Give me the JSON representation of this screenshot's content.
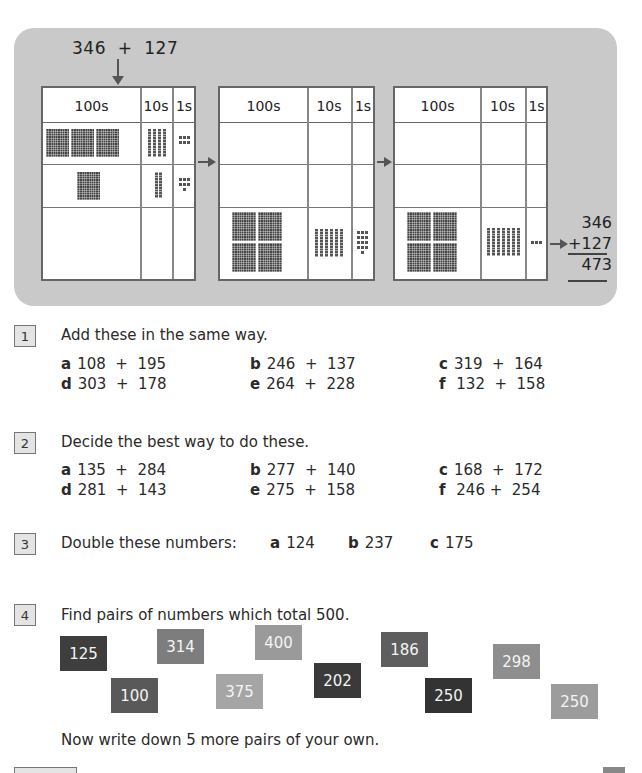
{
  "demo": {
    "expression": "346  +  127",
    "headers": [
      "100s",
      "10s",
      "1s"
    ],
    "panels": [
      {
        "stage": "start",
        "row1": {
          "hundreds": 3,
          "tens": 4,
          "ones": 6
        },
        "row2": {
          "hundreds": 1,
          "tens": 2,
          "ones": 7
        },
        "row3": {
          "hundreds": 0,
          "tens": 0,
          "ones": 0
        }
      },
      {
        "stage": "combined",
        "row1": {
          "hundreds": 0,
          "tens": 0,
          "ones": 0
        },
        "row2": {
          "hundreds": 0,
          "tens": 0,
          "ones": 0
        },
        "row3": {
          "hundreds": 4,
          "tens": 6,
          "ones": 13
        }
      },
      {
        "stage": "exchanged",
        "row1": {
          "hundreds": 0,
          "tens": 0,
          "ones": 0
        },
        "row2": {
          "hundreds": 0,
          "tens": 0,
          "ones": 0
        },
        "row3": {
          "hundreds": 4,
          "tens": 7,
          "ones": 3
        }
      }
    ],
    "column_sum": {
      "top": "346",
      "addend": "+127",
      "result": "473"
    }
  },
  "questions": [
    {
      "number": "1",
      "prompt": "Add these in the same way.",
      "items": [
        {
          "label": "a",
          "text": "108  +  195"
        },
        {
          "label": "b",
          "text": "246  +  137"
        },
        {
          "label": "c",
          "text": "319  +  164"
        },
        {
          "label": "d",
          "text": "303  +  178"
        },
        {
          "label": "e",
          "text": "264  +  228"
        },
        {
          "label": "f",
          "text": " 132  +  158"
        }
      ]
    },
    {
      "number": "2",
      "prompt": "Decide the best way to do these.",
      "items": [
        {
          "label": "a",
          "text": "135  +  284"
        },
        {
          "label": "b",
          "text": "277  +  140"
        },
        {
          "label": "c",
          "text": "168  +  172"
        },
        {
          "label": "d",
          "text": "281  +  143"
        },
        {
          "label": "e",
          "text": "275  +  158"
        },
        {
          "label": "f",
          "text": " 246 +  254"
        }
      ]
    },
    {
      "number": "3",
      "prompt": "Double these numbers:",
      "items": [
        {
          "label": "a",
          "text": "124"
        },
        {
          "label": "b",
          "text": "237"
        },
        {
          "label": "c",
          "text": "175"
        }
      ]
    },
    {
      "number": "4",
      "prompt": "Find pairs of numbers which total 500.",
      "cards": [
        {
          "value": "125",
          "color": "#3e3e3e"
        },
        {
          "value": "314",
          "color": "#7d7d7d"
        },
        {
          "value": "400",
          "color": "#9a9a9a"
        },
        {
          "value": "186",
          "color": "#5e5e5e"
        },
        {
          "value": "298",
          "color": "#8e8e8e"
        },
        {
          "value": "100",
          "color": "#595959"
        },
        {
          "value": "375",
          "color": "#a5a5a5"
        },
        {
          "value": "202",
          "color": "#3a3a3a"
        },
        {
          "value": "250",
          "color": "#333333"
        },
        {
          "value": "250",
          "color": "#9c9c9c"
        }
      ],
      "followup": "Now write down 5 more pairs of your own."
    }
  ]
}
